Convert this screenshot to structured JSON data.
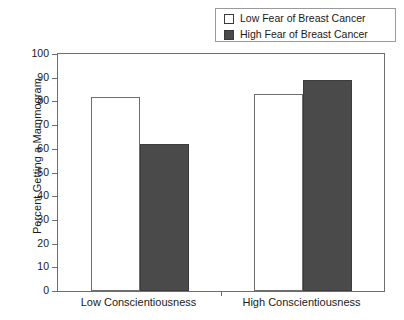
{
  "chart_data": {
    "type": "bar",
    "title": "",
    "subtitle": "",
    "xlabel": "",
    "ylabel": "Percent Getting a Mammogram",
    "ylim": [
      0,
      100
    ],
    "yticks": [
      0,
      10,
      20,
      30,
      40,
      50,
      60,
      70,
      80,
      90,
      100
    ],
    "ytick_labels": [
      "0",
      "10",
      "20",
      "30",
      "40",
      "50",
      "60",
      "70",
      "80",
      "90",
      "100"
    ],
    "grid": false,
    "legend_position": "top-right",
    "categories": [
      "Low Conscientiousness",
      "High Conscientiousness"
    ],
    "series": [
      {
        "name": "Low Fear of Breast Cancer",
        "color": "#ffffff",
        "edge_color": "#6e6e6e",
        "values": [
          82,
          83
        ]
      },
      {
        "name": "High Fear of Breast Cancer",
        "color": "#4a4a4a",
        "edge_color": "#3c3c3c",
        "values": [
          62,
          89
        ]
      }
    ],
    "annotations": []
  },
  "legend": {
    "items": [
      {
        "label": "Low Fear of Breast Cancer",
        "swatch": "light-square-swatch"
      },
      {
        "label": "High Fear of Breast Cancer",
        "swatch": "dark-square-swatch"
      }
    ]
  },
  "axes": {
    "y_title": "Percent Getting a Mammogram",
    "y_labels": [
      "100",
      "90",
      "80",
      "70",
      "60",
      "50",
      "40",
      "30",
      "20",
      "10",
      "0"
    ],
    "x_labels": [
      "Low Conscientiousness",
      "High Conscientiousness"
    ]
  },
  "colors": {
    "light_bar": "#ffffff",
    "dark_bar": "#4a4a4a",
    "axis": "#6e6e6e",
    "text": "#1a1a1a",
    "background": "#ffffff"
  }
}
